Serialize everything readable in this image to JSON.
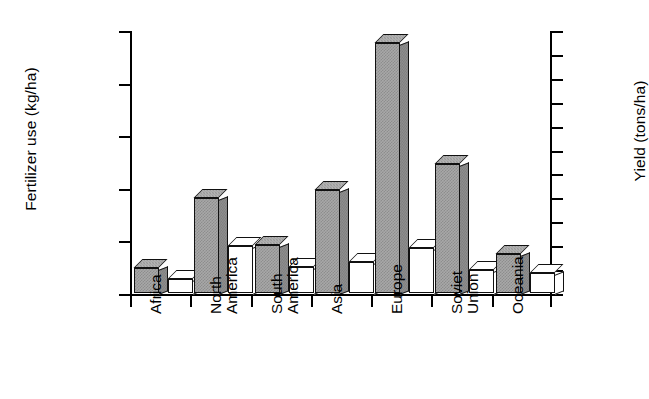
{
  "chart_data": {
    "type": "bar",
    "title": "",
    "categories": [
      "Africa",
      "North America",
      "South America",
      "Asia",
      "Europe",
      "Soviet Union",
      "Oceania"
    ],
    "category_lines": [
      [
        "Africa"
      ],
      [
        "North",
        "America"
      ],
      [
        "South",
        "America"
      ],
      [
        "Asia"
      ],
      [
        "Europe"
      ],
      [
        "Soviet",
        "Union"
      ],
      [
        "Oceania"
      ]
    ],
    "series": [
      {
        "name": "Fertilizer use",
        "axis": "left",
        "style": "gray-3d",
        "units": "kg/ha",
        "values": [
          24,
          90,
          46,
          98,
          238,
          123,
          37
        ]
      },
      {
        "name": "Yield",
        "axis": "right",
        "style": "white-3d",
        "units": "tons/ha",
        "values": [
          1.2,
          3.9,
          2.2,
          2.6,
          3.8,
          1.9,
          1.7
        ]
      }
    ],
    "xlabel": "",
    "ylabel": "Fertilizer use (kg/ha)",
    "ylabel_right": "Yield (tons/ha)",
    "ylim": [
      0,
      250
    ],
    "ylim_right": [
      0,
      22
    ],
    "yticks": [
      0,
      50,
      100,
      150,
      200,
      250
    ],
    "yticks_right": [
      0,
      2,
      4,
      6,
      8,
      10,
      12,
      14,
      16,
      18,
      20,
      22
    ],
    "grid": false,
    "legend": "none",
    "colors": {
      "bar_fill_gray": "#a8a8a8",
      "bar_fill_white": "#ffffff",
      "outline": "#111111",
      "axis": "#000000",
      "background": "#ffffff"
    }
  },
  "axes": {
    "left_title": "Fertilizer use (kg/ha)",
    "right_title": "Yield (tons/ha)"
  }
}
